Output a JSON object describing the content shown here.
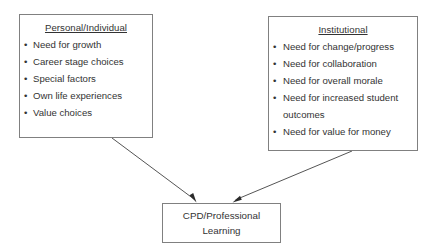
{
  "diagram": {
    "title_text": "",
    "colors": {
      "border": "#808080",
      "text": "#333333",
      "background": "#ffffff",
      "arrow": "#555555"
    },
    "nodes": {
      "personal": {
        "title": "Personal/Individual",
        "items": [
          "Need for growth",
          "Career stage choices",
          "Special factors",
          "Own life experiences",
          "Value choices"
        ]
      },
      "institutional": {
        "title": "Institutional",
        "items": [
          "Need for change/progress",
          "Need for collaboration",
          "Need for overall morale",
          "Need for increased student outcomes",
          "Need for value for money"
        ]
      },
      "cpd": {
        "line1": "CPD/Professional",
        "line2": "Learning"
      }
    },
    "arrows": [
      {
        "name": "personal-to-cpd",
        "from": "personal",
        "to": "cpd"
      },
      {
        "name": "institutional-to-cpd",
        "from": "institutional",
        "to": "cpd"
      }
    ]
  }
}
